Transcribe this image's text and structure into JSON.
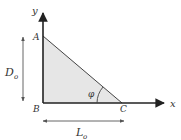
{
  "diagram": {
    "type": "right-triangle-geometry",
    "points": {
      "A": {
        "label": "A"
      },
      "B": {
        "label": "B"
      },
      "C": {
        "label": "C"
      }
    },
    "axes": {
      "x_label": "x",
      "y_label": "y"
    },
    "dimensions": {
      "height_label": "D",
      "height_subscript": "o",
      "width_label": "L",
      "width_subscript": "o"
    },
    "angle_label": "φ",
    "colors": {
      "fill": "#e6e6e6",
      "stroke": "#333333",
      "axis": "#222222",
      "dimension": "#555555"
    }
  }
}
